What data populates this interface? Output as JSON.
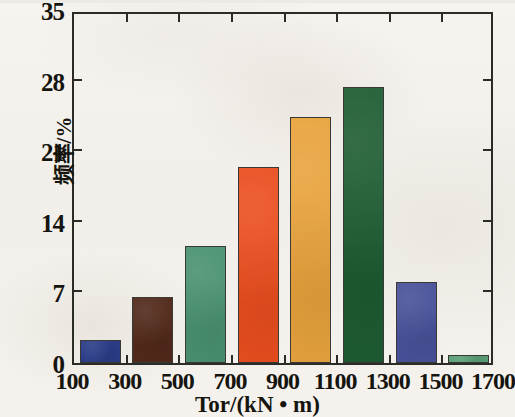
{
  "chart_data": {
    "type": "bar",
    "title": "",
    "subtitle": "",
    "xlabel": "Tor/(kN • m)",
    "ylabel": "频率/%",
    "xlim": [
      100,
      1700
    ],
    "ylim": [
      0,
      35
    ],
    "grid": false,
    "legend": "none",
    "x_tick_labels": [
      "100",
      "300",
      "500",
      "700",
      "900",
      "1100",
      "1300",
      "1500",
      "1700"
    ],
    "x_tick_values": [
      100,
      300,
      500,
      700,
      900,
      1100,
      1300,
      1500,
      1700
    ],
    "y_tick_labels": [
      "0",
      "7",
      "14",
      "21",
      "28",
      "35"
    ],
    "y_tick_values": [
      0,
      7,
      14,
      21,
      28,
      35
    ],
    "categories": [
      "100-300",
      "300-500",
      "500-700",
      "700-900",
      "900-1100",
      "1100-1300",
      "1300-1500",
      "1500-1700"
    ],
    "bin_starts": [
      100,
      300,
      500,
      700,
      900,
      1100,
      1300,
      1500
    ],
    "bin_ends": [
      300,
      500,
      700,
      900,
      1100,
      1300,
      1500,
      1700
    ],
    "values": [
      2.3,
      6.5,
      11.6,
      19.4,
      24.4,
      27.4,
      8.0,
      0.8
    ],
    "bar_colors": [
      "#2b3c87",
      "#51291a",
      "#4a9171",
      "#ea4e1f",
      "#e8a33d",
      "#1d5c33",
      "#49519a",
      "#5a9f77"
    ],
    "bar_edge_color": "#3a3a34",
    "axis_color": "#2b2b28",
    "background_color": "#f4f2ee",
    "series": [
      {
        "name": "频率",
        "values": [
          2.3,
          6.5,
          11.6,
          19.4,
          24.4,
          27.4,
          8.0,
          0.8
        ]
      }
    ]
  }
}
